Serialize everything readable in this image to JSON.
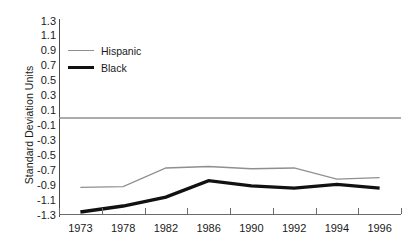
{
  "chart_data": {
    "type": "line",
    "title": "",
    "xlabel": "",
    "ylabel": "Standard Deviation Units",
    "categories": [
      "1973",
      "1978",
      "1982",
      "1986",
      "1990",
      "1992",
      "1994",
      "1996"
    ],
    "x": [
      1973,
      1978,
      1982,
      1986,
      1990,
      1992,
      1994,
      1996
    ],
    "ylim": [
      -1.3,
      1.3
    ],
    "ytick_labels": [
      "1.3",
      "1.1",
      "0.9",
      "0.7",
      "0.5",
      "0.3",
      "0.1",
      "-0.1",
      "-0.3",
      "-0.5",
      "-0.7",
      "-0.9",
      "-1.1",
      "-1.3"
    ],
    "ytick_values": [
      1.3,
      1.1,
      0.9,
      0.7,
      0.5,
      0.3,
      0.1,
      -0.1,
      -0.3,
      -0.5,
      -0.7,
      -0.9,
      -1.1,
      -1.3
    ],
    "grid": false,
    "zero_reference_line": 0,
    "legend_position": "upper-left-inside",
    "series": [
      {
        "name": "Hispanic",
        "color": "#8f8f8f",
        "line_width": 1.3,
        "values": [
          -0.93,
          -0.92,
          -0.67,
          -0.65,
          -0.68,
          -0.67,
          -0.82,
          -0.8
        ]
      },
      {
        "name": "Black",
        "color": "#111111",
        "line_width": 3.4,
        "values": [
          -1.26,
          -1.18,
          -1.06,
          -0.84,
          -0.91,
          -0.94,
          -0.89,
          -0.94
        ]
      }
    ]
  },
  "axis": {
    "y_title": "Standard Deviation Units",
    "axis_color": "#6b6b6b",
    "zero_line_color": "#8f8f8f"
  },
  "legend": {
    "items": [
      {
        "label": "Hispanic",
        "key": "hispanic"
      },
      {
        "label": "Black",
        "key": "black"
      }
    ]
  }
}
